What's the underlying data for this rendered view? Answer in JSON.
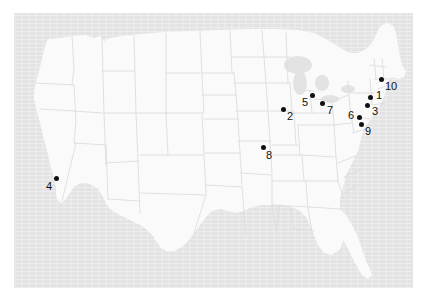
{
  "figure": {
    "kind": "us-map-with-numbered-site-markers",
    "background_color": "#ffffff",
    "panel_color": "#e3e3e3",
    "land_color": "#fafafa",
    "border_color": "#dcdcdc",
    "marker_color": "#111111",
    "title": "",
    "caption": ""
  },
  "map": {
    "region": "United States (contiguous)",
    "panel": {
      "x": 14,
      "y": 13,
      "width": 399,
      "height": 275
    }
  },
  "markers": [
    {
      "id": "1",
      "label": "1",
      "x": 370,
      "y": 97,
      "label_dx": 6,
      "label_dy": -1,
      "region": "Northeast"
    },
    {
      "id": "2",
      "label": "2",
      "x": 283,
      "y": 109,
      "label_dx": 4,
      "label_dy": 8,
      "region": "Midwest"
    },
    {
      "id": "3",
      "label": "3",
      "x": 367,
      "y": 105,
      "label_dx": 5,
      "label_dy": 7,
      "region": "Mid-Atlantic"
    },
    {
      "id": "4",
      "label": "4",
      "x": 56,
      "y": 178,
      "label_dx": -9,
      "label_dy": 8,
      "region": "California coast"
    },
    {
      "id": "5",
      "label": "5",
      "x": 312,
      "y": 95,
      "label_dx": -9,
      "label_dy": 7,
      "region": "Great Lakes"
    },
    {
      "id": "6",
      "label": "6",
      "x": 359,
      "y": 117,
      "label_dx": -9,
      "label_dy": -1,
      "region": "Mid-Atlantic"
    },
    {
      "id": "7",
      "label": "7",
      "x": 322,
      "y": 103,
      "label_dx": 5,
      "label_dy": 8,
      "region": "Ohio"
    },
    {
      "id": "8",
      "label": "8",
      "x": 263,
      "y": 147,
      "label_dx": 3,
      "label_dy": 9,
      "region": "Missouri"
    },
    {
      "id": "9",
      "label": "9",
      "x": 361,
      "y": 124,
      "label_dx": 4,
      "label_dy": 8,
      "region": "Mid-Atlantic"
    },
    {
      "id": "10",
      "label": "10",
      "x": 381,
      "y": 79,
      "label_dx": 4,
      "label_dy": 8,
      "region": "New England"
    }
  ]
}
